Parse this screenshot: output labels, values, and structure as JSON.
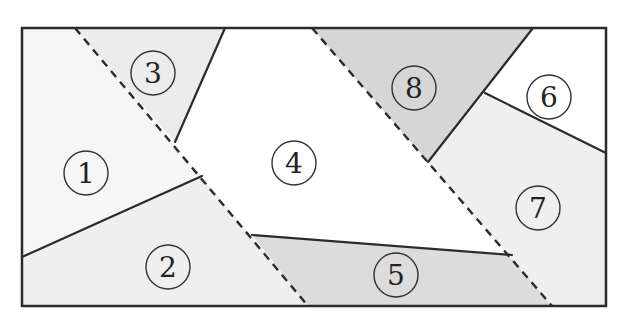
{
  "diagram": {
    "frame": {
      "x1": 22,
      "y1": 28,
      "x2": 606,
      "y2": 306,
      "stroke": "#2b2b2b"
    },
    "colors": {
      "white": "#ffffff",
      "light": "#f0f0f0",
      "medium": "#d9d9d9",
      "line": "#2b2b2b",
      "circle": "#333333"
    },
    "regions": [
      {
        "id": "1",
        "label": "1",
        "fill": "#f6f6f6",
        "points": "22,28 75,28 202,176 22,257",
        "cx": 86,
        "cy": 173
      },
      {
        "id": "2",
        "label": "2",
        "fill": "#efefef",
        "points": "22,257 202,176 308,306 22,306",
        "cx": 168,
        "cy": 267
      },
      {
        "id": "3",
        "label": "3",
        "fill": "#ececec",
        "points": "75,28 225,28 175,142",
        "cx": 153,
        "cy": 73
      },
      {
        "id": "4",
        "label": "4",
        "fill": "#ffffff",
        "points": "225,28 312,28 512,255 252,235 202,176 175,142",
        "cx": 294,
        "cy": 163
      },
      {
        "id": "5",
        "label": "5",
        "fill": "#dcdcdc",
        "points": "252,235 512,255 552,306 308,306",
        "cx": 396,
        "cy": 275
      },
      {
        "id": "6",
        "label": "6",
        "fill": "#ffffff",
        "points": "533,28 606,28 606,153 485,93",
        "cx": 549,
        "cy": 97
      },
      {
        "id": "7",
        "label": "7",
        "fill": "#efefef",
        "points": "485,93 606,153 606,306 552,306 428,162",
        "cx": 538,
        "cy": 208
      },
      {
        "id": "8",
        "label": "8",
        "fill": "#d6d6d6",
        "points": "312,28 533,28 428,162",
        "cx": 414,
        "cy": 88
      }
    ],
    "solid_lines": [
      {
        "x1": 225,
        "y1": 28,
        "x2": 175,
        "y2": 142
      },
      {
        "x1": 22,
        "y1": 257,
        "x2": 202,
        "y2": 176
      },
      {
        "x1": 252,
        "y1": 235,
        "x2": 512,
        "y2": 255
      },
      {
        "x1": 533,
        "y1": 28,
        "x2": 428,
        "y2": 162
      },
      {
        "x1": 485,
        "y1": 93,
        "x2": 606,
        "y2": 153
      }
    ],
    "dashed_lines": [
      {
        "x1": 75,
        "y1": 28,
        "x2": 308,
        "y2": 306
      },
      {
        "x1": 312,
        "y1": 28,
        "x2": 552,
        "y2": 306
      }
    ],
    "circle_radius": 22
  }
}
